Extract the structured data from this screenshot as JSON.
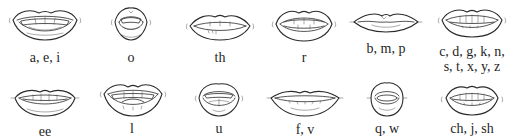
{
  "title": "Mouth shapes for letter sounds",
  "rows": [
    {
      "cells": [
        {
          "label": "a, e, i",
          "shape": "wide-open-smile"
        },
        {
          "label": "o",
          "shape": "round-open"
        },
        {
          "label": "th",
          "shape": "tongue-between-teeth"
        },
        {
          "label": "r",
          "shape": "open-teeth-showing"
        },
        {
          "label": "b, m, p",
          "shape": "closed-lips"
        },
        {
          "label_line1": "c, d, g, k, n,",
          "label_line2": "s, t, x, y, z",
          "shape": "teeth-together-smile"
        }
      ]
    },
    {
      "cells": [
        {
          "label": "ee",
          "shape": "wide-smile-teeth"
        },
        {
          "label": "l",
          "shape": "open-tongue-up"
        },
        {
          "label": "u",
          "shape": "small-round-open"
        },
        {
          "label": "f, v",
          "shape": "teeth-on-lower-lip"
        },
        {
          "label": "q, w",
          "shape": "puckered-round"
        },
        {
          "label": "ch, j, sh",
          "shape": "teeth-together-protruded"
        }
      ]
    }
  ],
  "colors": {
    "background": "#ffffff",
    "ink": "#2a2a2a"
  }
}
